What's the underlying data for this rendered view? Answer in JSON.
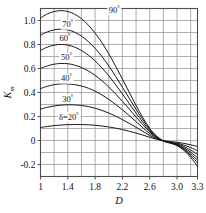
{
  "chart_data": {
    "type": "line",
    "title": "",
    "xlabel": "D",
    "ylabel": "K",
    "ylabel_sub": "m",
    "xlim": [
      1,
      3.3
    ],
    "ylim": [
      -0.3,
      1.1
    ],
    "grid": true,
    "grid_x_step": 0.2,
    "grid_y_step": 0.1,
    "legend_position": "inline-labels",
    "xticks": [
      1,
      1.4,
      1.8,
      2.2,
      2.6,
      3.0,
      3.3
    ],
    "xticklabels": [
      "1",
      "1.4",
      "1.8",
      "2.2",
      "2.6",
      "3.0",
      "3.3"
    ],
    "yticks": [
      1.0,
      0.8,
      0.6,
      0.4,
      0.2,
      0,
      -0.2
    ],
    "yticklabels": [
      "1.0",
      "0.8",
      "0.6",
      "0.4",
      "0.2",
      "0",
      "-0.2"
    ],
    "series": [
      {
        "name": "90°",
        "label": "90",
        "label_suffix": "°",
        "label_x": 2.0,
        "label_y": 1.065,
        "x": [
          1.0,
          1.1,
          1.2,
          1.3,
          1.4,
          1.5,
          1.6,
          1.7,
          1.8,
          1.9,
          2.0,
          2.1,
          2.2,
          2.3,
          2.4,
          2.5,
          2.6,
          2.7,
          2.8,
          2.9,
          3.0,
          3.1,
          3.2,
          3.3
        ],
        "y": [
          1.02,
          1.055,
          1.075,
          1.082,
          1.075,
          1.052,
          1.015,
          0.962,
          0.895,
          0.815,
          0.722,
          0.62,
          0.512,
          0.402,
          0.292,
          0.19,
          0.1,
          0.035,
          -0.005,
          -0.022,
          -0.042,
          -0.082,
          -0.14,
          -0.215
        ]
      },
      {
        "name": "70°",
        "label": "70",
        "label_suffix": "°",
        "label_x": 1.32,
        "label_y": 0.945,
        "x": [
          1.0,
          1.1,
          1.2,
          1.3,
          1.4,
          1.5,
          1.6,
          1.7,
          1.8,
          1.9,
          2.0,
          2.1,
          2.2,
          2.3,
          2.4,
          2.5,
          2.6,
          2.7,
          2.8,
          2.9,
          3.0,
          3.1,
          3.2,
          3.3
        ],
        "y": [
          0.878,
          0.905,
          0.922,
          0.928,
          0.922,
          0.902,
          0.87,
          0.825,
          0.768,
          0.7,
          0.622,
          0.535,
          0.444,
          0.352,
          0.26,
          0.172,
          0.094,
          0.036,
          -0.002,
          -0.02,
          -0.04,
          -0.075,
          -0.125,
          -0.185
        ]
      },
      {
        "name": "60°",
        "label": "60",
        "label_suffix": "°",
        "label_x": 1.28,
        "label_y": 0.83,
        "x": [
          1.0,
          1.1,
          1.2,
          1.3,
          1.4,
          1.5,
          1.6,
          1.7,
          1.8,
          1.9,
          2.0,
          2.1,
          2.2,
          2.3,
          2.4,
          2.5,
          2.6,
          2.7,
          2.8,
          2.9,
          3.0,
          3.1,
          3.2,
          3.3
        ],
        "y": [
          0.752,
          0.778,
          0.795,
          0.8,
          0.795,
          0.778,
          0.75,
          0.712,
          0.663,
          0.605,
          0.54,
          0.465,
          0.388,
          0.308,
          0.228,
          0.151,
          0.082,
          0.029,
          -0.004,
          -0.02,
          -0.037,
          -0.068,
          -0.112,
          -0.163
        ]
      },
      {
        "name": "50°",
        "label": "50",
        "label_suffix": "°",
        "label_x": 1.3,
        "label_y": 0.67,
        "x": [
          1.0,
          1.1,
          1.2,
          1.3,
          1.4,
          1.5,
          1.6,
          1.7,
          1.8,
          1.9,
          2.0,
          2.1,
          2.2,
          2.3,
          2.4,
          2.5,
          2.6,
          2.7,
          2.8,
          2.9,
          3.0,
          3.1,
          3.2,
          3.3
        ],
        "y": [
          0.6,
          0.622,
          0.636,
          0.642,
          0.64,
          0.628,
          0.608,
          0.58,
          0.543,
          0.498,
          0.446,
          0.388,
          0.326,
          0.262,
          0.195,
          0.131,
          0.072,
          0.025,
          -0.004,
          -0.018,
          -0.033,
          -0.06,
          -0.098,
          -0.142
        ]
      },
      {
        "name": "40°",
        "label": "40",
        "label_suffix": "°",
        "label_x": 1.3,
        "label_y": 0.495,
        "x": [
          1.0,
          1.1,
          1.2,
          1.3,
          1.4,
          1.5,
          1.6,
          1.7,
          1.8,
          1.9,
          2.0,
          2.1,
          2.2,
          2.3,
          2.4,
          2.5,
          2.6,
          2.7,
          2.8,
          2.9,
          3.0,
          3.1,
          3.2,
          3.3
        ],
        "y": [
          0.432,
          0.452,
          0.465,
          0.472,
          0.472,
          0.466,
          0.454,
          0.436,
          0.411,
          0.38,
          0.343,
          0.301,
          0.256,
          0.207,
          0.157,
          0.106,
          0.058,
          0.019,
          -0.004,
          -0.016,
          -0.028,
          -0.05,
          -0.08,
          -0.115
        ]
      },
      {
        "name": "30°",
        "label": "30",
        "label_suffix": "°",
        "label_x": 1.32,
        "label_y": 0.325,
        "x": [
          1.0,
          1.1,
          1.2,
          1.3,
          1.4,
          1.5,
          1.6,
          1.7,
          1.8,
          1.9,
          2.0,
          2.1,
          2.2,
          2.3,
          2.4,
          2.5,
          2.6,
          2.7,
          2.8,
          2.9,
          3.0,
          3.1,
          3.2,
          3.3
        ],
        "y": [
          0.262,
          0.277,
          0.288,
          0.295,
          0.298,
          0.297,
          0.292,
          0.283,
          0.269,
          0.251,
          0.229,
          0.203,
          0.174,
          0.143,
          0.11,
          0.076,
          0.042,
          0.014,
          -0.003,
          -0.013,
          -0.022,
          -0.038,
          -0.059,
          -0.085
        ]
      },
      {
        "name": "δ=20°",
        "label": "δ=20",
        "label_suffix": "°",
        "label_x": 1.27,
        "label_y": 0.175,
        "x": [
          1.0,
          1.1,
          1.2,
          1.3,
          1.4,
          1.5,
          1.6,
          1.7,
          1.8,
          1.9,
          2.0,
          2.1,
          2.2,
          2.3,
          2.4,
          2.5,
          2.6,
          2.7,
          2.8,
          2.9,
          3.0,
          3.1,
          3.2,
          3.3
        ],
        "y": [
          0.108,
          0.117,
          0.124,
          0.129,
          0.132,
          0.133,
          0.133,
          0.131,
          0.127,
          0.121,
          0.113,
          0.103,
          0.091,
          0.077,
          0.062,
          0.045,
          0.027,
          0.01,
          -0.002,
          -0.009,
          -0.015,
          -0.024,
          -0.036,
          -0.05
        ]
      }
    ],
    "colors": {
      "curve": "#1a1a1a",
      "grid": "#8c8c8c",
      "axis": "#4d4d4d",
      "text": "#111111",
      "background": "#ffffff"
    }
  }
}
